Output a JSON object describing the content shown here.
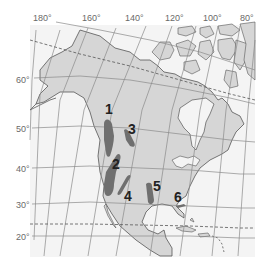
{
  "map": {
    "title": "North America",
    "colors": {
      "ocean": "#f4f4f4",
      "land": "#d6d6d6",
      "coast": "#555555",
      "grid": "#8a8a8a",
      "region": "#6f6f6f",
      "label": "#6a6a6a"
    },
    "longitude_labels": [
      {
        "text": "180°",
        "x": 33,
        "y": 14
      },
      {
        "text": "160°",
        "x": 82,
        "y": 14
      },
      {
        "text": "140°",
        "x": 125,
        "y": 14
      },
      {
        "text": "120°",
        "x": 165,
        "y": 14
      },
      {
        "text": "100°",
        "x": 203,
        "y": 14
      },
      {
        "text": "80°",
        "x": 240,
        "y": 14
      }
    ],
    "latitude_labels": [
      {
        "text": "60°",
        "x": 18,
        "y": 76
      },
      {
        "text": "50°",
        "x": 18,
        "y": 125
      },
      {
        "text": "40°",
        "x": 18,
        "y": 165
      },
      {
        "text": "30°",
        "x": 18,
        "y": 201
      },
      {
        "text": "20°",
        "x": 18,
        "y": 233
      }
    ],
    "regions": [
      {
        "id": "1",
        "label": "1",
        "lx": 106,
        "ly": 102
      },
      {
        "id": "2",
        "label": "2",
        "lx": 112,
        "ly": 157
      },
      {
        "id": "3",
        "label": "3",
        "lx": 128,
        "ly": 122
      },
      {
        "id": "4",
        "label": "4",
        "lx": 124,
        "ly": 189
      },
      {
        "id": "5",
        "label": "5",
        "lx": 153,
        "ly": 180
      },
      {
        "id": "6",
        "label": "6",
        "lx": 174,
        "ly": 190
      }
    ],
    "reference_lines": [
      "Arctic Circle (dashed)",
      "Tropic of Cancer (dashed)"
    ]
  }
}
